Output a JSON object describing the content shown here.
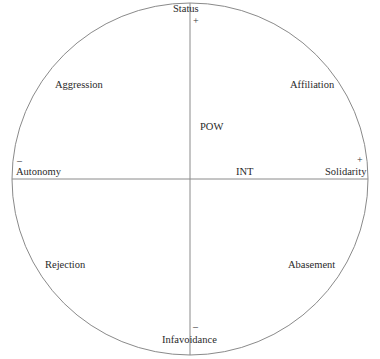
{
  "diagram": {
    "type": "circumplex",
    "axes": {
      "vertical": {
        "top_label": "Status",
        "top_sign": "+",
        "bottom_label": "Infavoidance",
        "bottom_sign": "–"
      },
      "horizontal": {
        "left_label": "Autonomy",
        "left_sign": "–",
        "right_label": "Solidarity",
        "right_sign": "+"
      }
    },
    "quadrants": {
      "top_left": "Aggression",
      "top_right": "Affiliation",
      "bottom_left": "Rejection",
      "bottom_right": "Abasement"
    },
    "inner_labels": {
      "power": "POW",
      "intimacy": "INT"
    },
    "colors": {
      "line": "#8a8a8a",
      "text": "#2a2a2a"
    }
  }
}
